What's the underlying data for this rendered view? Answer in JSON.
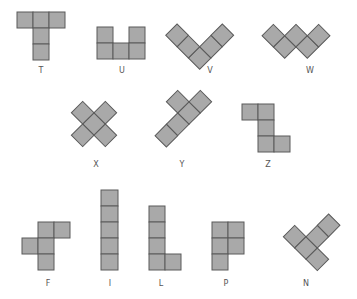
{
  "diagram": {
    "cell_fill": "#a9a9a9",
    "cell_stroke": "#5a5a5a",
    "label_color": "#555555",
    "pieces": [
      {
        "name": "T",
        "label": "T"
      },
      {
        "name": "U",
        "label": "U"
      },
      {
        "name": "V",
        "label": "V"
      },
      {
        "name": "W",
        "label": "W"
      },
      {
        "name": "X",
        "label": "X"
      },
      {
        "name": "Y",
        "label": "Y"
      },
      {
        "name": "Z",
        "label": "Z"
      },
      {
        "name": "F",
        "label": "F"
      },
      {
        "name": "I",
        "label": "I"
      },
      {
        "name": "L",
        "label": "L"
      },
      {
        "name": "P",
        "label": "P"
      },
      {
        "name": "N",
        "label": "N"
      }
    ]
  }
}
